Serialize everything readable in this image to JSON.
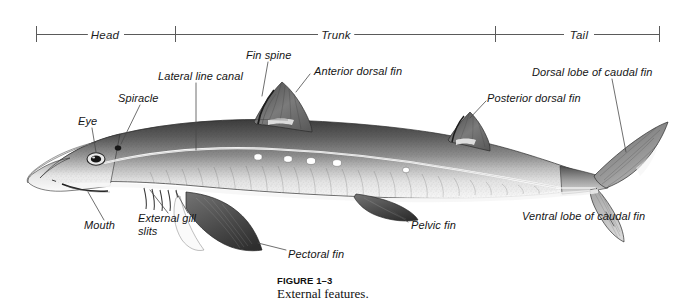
{
  "figure": {
    "number_label": "FIGURE 1–3",
    "caption": "External features."
  },
  "region_bar": {
    "segments": [
      {
        "label": "Head",
        "start_x": 36,
        "end_x": 175,
        "center_x": 105
      },
      {
        "label": "Trunk",
        "start_x": 175,
        "end_x": 495,
        "center_x": 335
      },
      {
        "label": "Tail",
        "start_x": 495,
        "end_x": 660,
        "center_x": 578
      }
    ],
    "tick_positions": [
      36,
      175,
      495,
      660
    ],
    "baseline_y": 34,
    "tick_height": 16
  },
  "labels": [
    {
      "id": "eye",
      "text": "Eye",
      "x": 78,
      "y": 122,
      "align": "left"
    },
    {
      "id": "spiracle",
      "text": "Spiracle",
      "x": 120,
      "y": 99,
      "align": "left"
    },
    {
      "id": "lateral-line-canal",
      "text": "Lateral line canal",
      "x": 159,
      "y": 77,
      "align": "left"
    },
    {
      "id": "fin-spine",
      "text": "Fin spine",
      "x": 246,
      "y": 56,
      "align": "left"
    },
    {
      "id": "anterior-dorsal-fin",
      "text": "Anterior dorsal fin",
      "x": 314,
      "y": 72,
      "align": "left"
    },
    {
      "id": "posterior-dorsal-fin",
      "text": "Posterior dorsal fin",
      "x": 488,
      "y": 99,
      "align": "left"
    },
    {
      "id": "dorsal-lobe-caudal-fin",
      "text": "Dorsal lobe of caudal fin",
      "x": 532,
      "y": 73,
      "align": "left"
    },
    {
      "id": "ventral-lobe-caudal-fin",
      "text": "Ventral lobe of caudal fin",
      "x": 523,
      "y": 216,
      "align": "left"
    },
    {
      "id": "pelvic-fin",
      "text": "Pelvic fin",
      "x": 412,
      "y": 225,
      "align": "left"
    },
    {
      "id": "pectoral-fin",
      "text": "Pectoral fin",
      "x": 288,
      "y": 254,
      "align": "left"
    },
    {
      "id": "external-gill-slits",
      "text": "External gill slits",
      "x": 139,
      "y": 218,
      "align": "left"
    },
    {
      "id": "mouth",
      "text": "Mouth",
      "x": 85,
      "y": 225,
      "align": "left"
    }
  ],
  "colors": {
    "ink": "#1a1a1a",
    "leader_line": "#4a4a4a",
    "region_rule": "#5a5a5a",
    "body_dark": "#4b4b4b",
    "body_mid": "#8a8a8a",
    "body_light": "#d8d8d8",
    "belly": "#f4f4f4",
    "background": "#ffffff",
    "spot": "#ffffff"
  },
  "anatomy": {
    "white_spot_count": 5,
    "gill_slit_count": 5
  }
}
